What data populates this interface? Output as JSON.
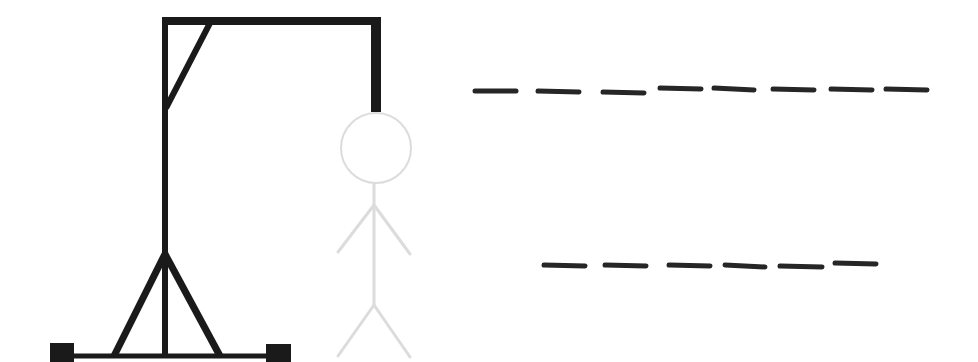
{
  "game": {
    "type": "hangman",
    "wrong_guesses_shown": 0,
    "colors": {
      "gallows": "#1a1a1a",
      "figure_inactive": "#dcdcdc",
      "dashes": "#262626",
      "background": "#ffffff"
    }
  },
  "gallows": {
    "parts": [
      "base",
      "left-foot",
      "right-foot",
      "left-leg-brace",
      "right-leg-brace",
      "pole",
      "top-beam",
      "corner-brace",
      "rope"
    ]
  },
  "figure": {
    "parts": [
      "head",
      "body",
      "left-arm",
      "right-arm",
      "left-leg",
      "right-leg"
    ],
    "state": "hidden-outline"
  },
  "word": {
    "lines": [
      {
        "length": 8,
        "letters": [
          "",
          "",
          "",
          "",
          "",
          "",
          "",
          ""
        ]
      },
      {
        "length": 6,
        "letters": [
          "",
          "",
          "",
          "",
          "",
          ""
        ]
      }
    ]
  }
}
